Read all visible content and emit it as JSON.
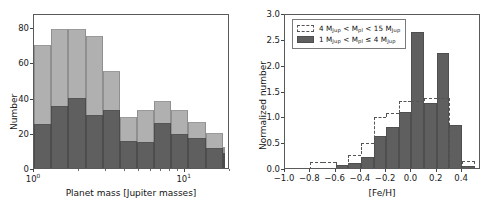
{
  "figure": {
    "panels": [
      "left",
      "right"
    ]
  },
  "left_panel": {
    "xlabel": "Planet mass [Jupiter masses]",
    "ylabel": "Number",
    "xticks": [
      {
        "label_base": "10",
        "label_exp": "0",
        "value": 1
      },
      {
        "label_base": "10",
        "label_exp": "1",
        "value": 10
      }
    ],
    "yticks": [
      "0",
      "20",
      "40",
      "60",
      "80"
    ]
  },
  "right_panel": {
    "xlabel": "[Fe/H]",
    "ylabel": "Normalized number",
    "xticks": [
      "−1.0",
      "−0.8",
      "−0.6",
      "−0.4",
      "−0.2",
      "0.0",
      "0.2",
      "0.4"
    ],
    "yticks": [
      "0.0",
      "0.5",
      "1.0",
      "1.5",
      "2.0",
      "2.5",
      "3.0"
    ],
    "legend": {
      "entry_dashed_pre": "4 M",
      "entry_dashed_sub1": "Jup",
      "entry_dashed_mid": " < M",
      "entry_dashed_sub2": "pl",
      "entry_dashed_mid2": " < 15 M",
      "entry_dashed_sub3": "Jup",
      "entry_solid_pre": "1 M",
      "entry_solid_sub1": "Jup",
      "entry_solid_mid": " < M",
      "entry_solid_sub2": "pl",
      "entry_solid_mid2": " ≤ 4 M",
      "entry_solid_sub3": "Jup"
    }
  },
  "colors": {
    "total_bar": "#b0b0b0",
    "sub_bar": "#5f5f5f",
    "axis": "#5a5a5a",
    "background": "#ffffff"
  },
  "chart_data": [
    {
      "type": "bar",
      "panel": "left",
      "title": "",
      "xlabel": "Planet mass [Jupiter masses]",
      "ylabel": "Number",
      "xscale": "log",
      "xlim": [
        1.0,
        20.0
      ],
      "ylim": [
        0,
        88
      ],
      "grid": false,
      "legend_position": "none",
      "bin_edges": [
        1.0,
        1.3,
        1.69,
        2.2,
        2.86,
        3.71,
        4.83,
        6.28,
        8.16,
        10.6,
        13.8,
        17.9
      ],
      "series": [
        {
          "name": "All planets (total)",
          "color": "#b0b0b0",
          "values": [
            70,
            79,
            79,
            75,
            55,
            29,
            33,
            38,
            33,
            26,
            20,
            12
          ]
        },
        {
          "name": "Lower sub-population",
          "color": "#5f5f5f",
          "values": [
            25,
            35,
            40,
            30,
            33,
            15.5,
            14.5,
            25.5,
            19.5,
            17,
            11.5,
            8.5
          ]
        }
      ]
    },
    {
      "type": "bar",
      "panel": "right",
      "title": "",
      "xlabel": "[Fe/H]",
      "ylabel": "Normalized number",
      "xlim": [
        -1.0,
        0.55
      ],
      "ylim": [
        0.0,
        3.0
      ],
      "grid": false,
      "legend_position": "upper left",
      "bin_edges": [
        -1.0,
        -0.9,
        -0.8,
        -0.7,
        -0.6,
        -0.5,
        -0.4,
        -0.3,
        -0.2,
        -0.1,
        0.0,
        0.1,
        0.2,
        0.3,
        0.4,
        0.5
      ],
      "bin_edges_coarse": [
        -1.0,
        -0.8,
        -0.6,
        -0.5,
        -0.4,
        -0.3,
        -0.2,
        -0.1,
        0.0,
        0.1,
        0.2,
        0.3,
        0.4,
        0.5
      ],
      "series": [
        {
          "name": "1 MJup < Mpl <= 4 MJup",
          "style": "filled",
          "color": "#5f5f5f",
          "bin_edges": [
            -0.7,
            -0.6,
            -0.5,
            -0.4,
            -0.3,
            -0.2,
            -0.1,
            0.0,
            0.1,
            0.2,
            0.3,
            0.4,
            0.5
          ],
          "values": [
            0.0,
            0.05,
            0.1,
            0.22,
            0.62,
            0.79,
            1.09,
            2.63,
            1.26,
            2.23,
            0.84,
            0.04
          ]
        },
        {
          "name": "4 MJup < Mpl < 15 MJup",
          "style": "dashed-step",
          "color": "#555555",
          "bin_edges": [
            -0.9,
            -0.8,
            -0.7,
            -0.6,
            -0.5,
            -0.4,
            -0.3,
            -0.2,
            -0.1,
            0.0,
            0.1,
            0.2,
            0.3,
            0.4,
            0.5
          ],
          "values": [
            0.0,
            0.16,
            0.16,
            0.0,
            0.3,
            0.52,
            1.03,
            1.1,
            1.34,
            1.34,
            1.4,
            1.4,
            0.0,
            0.18
          ]
        }
      ]
    }
  ]
}
